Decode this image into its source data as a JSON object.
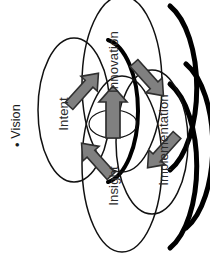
{
  "figure": {
    "title": "Vision",
    "bullet_glyph": "•",
    "background_color": "#ffffff",
    "text_color": "#2b2b2b",
    "rotation_note": "diagram rendered rotated 90 degrees counter-clockwise"
  },
  "diagram": {
    "type": "four-ellipse overlapping venn with interchange arrows",
    "ellipse_outline_color": "#111111",
    "ellipse_fill_color": "#ffffff",
    "shadow_color": "#000000",
    "arrow_fill_color": "#808080",
    "arrow_outline_color": "#333333",
    "ellipses": [
      {
        "key": "intent",
        "label": "Intent",
        "position": "left"
      },
      {
        "key": "innovation",
        "label": "Innovation",
        "position": "top"
      },
      {
        "key": "insight",
        "label": "Insight",
        "position": "bottom"
      },
      {
        "key": "implementation",
        "label": "Implementation",
        "position": "right"
      }
    ],
    "arrows": [
      {
        "key": "center-arrow",
        "from": "center",
        "to": "innovation",
        "direction": "up"
      },
      {
        "key": "intent-to-innovation-arrow",
        "from": "intent",
        "to": "innovation",
        "direction": "up-right"
      },
      {
        "key": "innovation-to-implementation-arrow",
        "from": "innovation",
        "to": "implementation",
        "direction": "down-right"
      },
      {
        "key": "insight-to-intent-arrow",
        "from": "insight",
        "to": "intent",
        "direction": "up-left"
      },
      {
        "key": "implementation-to-insight-arrow",
        "from": "implementation",
        "to": "insight",
        "direction": "down-left"
      }
    ]
  }
}
